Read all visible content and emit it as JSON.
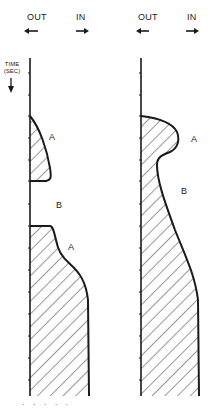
{
  "panels": [
    {
      "id": "left",
      "direction_labels": {
        "out": "OUT",
        "in": "IN"
      },
      "region_labels": [
        "A",
        "B",
        "A"
      ]
    },
    {
      "id": "right",
      "direction_labels": {
        "out": "OUT",
        "in": "IN"
      },
      "region_labels": [
        "A",
        "B"
      ]
    }
  ],
  "axis": {
    "label_line1": "TIME",
    "label_line2": "(SEC)"
  },
  "arrows": {
    "out": "left-arrow",
    "in": "right-arrow"
  },
  "colors": {
    "ink": "#1a1a1a",
    "hatch": "#333333",
    "background": "#ffffff"
  },
  "caption": "· · · · ·"
}
